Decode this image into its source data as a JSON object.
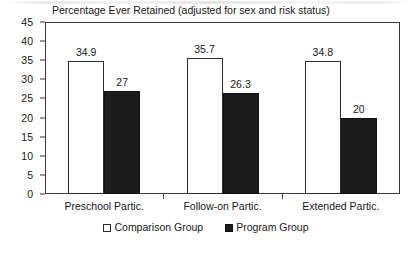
{
  "chart_data": {
    "type": "bar",
    "title": "Percentage Ever Retained (adjusted for sex and risk status)",
    "xlabel": "",
    "ylabel": "",
    "ylim": [
      0,
      45
    ],
    "ytick_step": 5,
    "yticks": [
      "45",
      "40",
      "35",
      "30",
      "25",
      "20",
      "15",
      "10",
      "5",
      "0"
    ],
    "grid": false,
    "legend_position": "bottom-center",
    "categories": [
      "Preschool Partic.",
      "Follow-on Partic.",
      "Extended Partic."
    ],
    "series": [
      {
        "name": "Comparison Group",
        "color": "#ffffff",
        "values": [
          34.9,
          35.7,
          34.8
        ],
        "labels": [
          "34.9",
          "35.7",
          "34.8"
        ]
      },
      {
        "name": "Program Group",
        "color": "#1c1c1c",
        "values": [
          27,
          26.3,
          20
        ],
        "labels": [
          "27",
          "26.3",
          "20"
        ]
      }
    ]
  },
  "legend": {
    "items": [
      {
        "label": "Comparison Group",
        "swatch": "white-square-icon"
      },
      {
        "label": "Program Group",
        "swatch": "black-square-icon"
      }
    ]
  }
}
